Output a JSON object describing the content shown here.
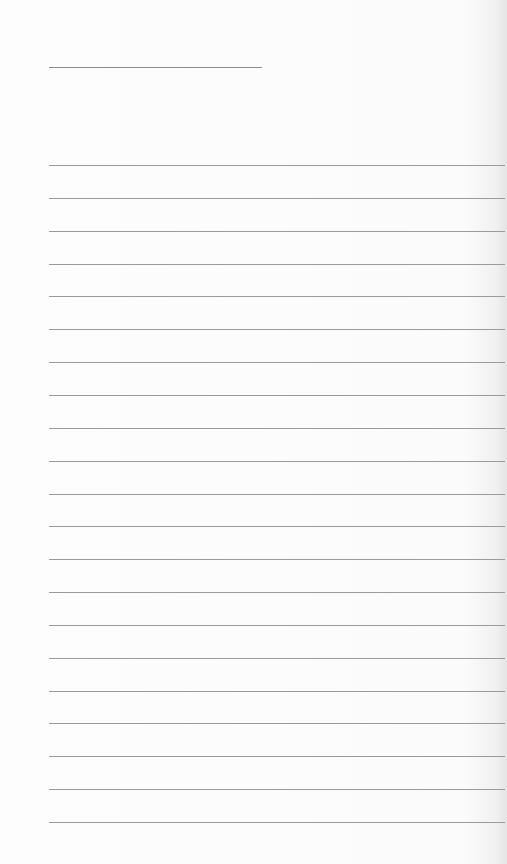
{
  "sheet": {
    "type": "lined-writing-paper",
    "line_color": "#9a9a9a",
    "title_line": {
      "x": 49,
      "y": 67,
      "width": 213
    },
    "ruled_lines": {
      "count": 21,
      "x": 49,
      "first_y": 165,
      "spacing": 32.85,
      "width": 456
    }
  }
}
